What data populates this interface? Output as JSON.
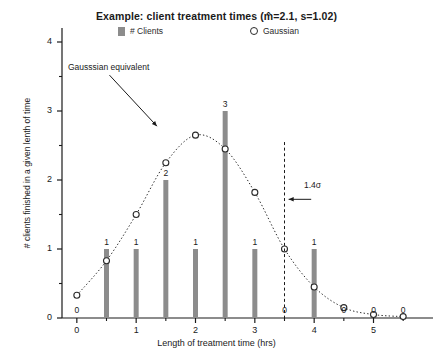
{
  "chart_data": {
    "type": "bar",
    "title": "Example: client treatment times (m̂=2.1, s=1.02)",
    "xlabel": "Length of treatment time (hrs)",
    "ylabel": "# clients finished in a given lenth of time",
    "xlim": [
      -0.25,
      5.75
    ],
    "ylim": [
      0,
      4
    ],
    "grid": false,
    "legend_position": "top",
    "x_ticks": [
      0,
      1,
      2,
      3,
      4,
      5
    ],
    "x_tick_labels": [
      "0",
      "1",
      "2",
      "3",
      "4",
      "5"
    ],
    "x_minor_ticks": [
      0.5,
      1.5,
      2.5,
      3.5,
      4.5,
      5.5
    ],
    "y_ticks": [
      0,
      1,
      2,
      3,
      4
    ],
    "y_tick_labels": [
      "0",
      "1",
      "2",
      "3",
      "4"
    ],
    "y_minor_ticks": [
      0.5,
      1.5,
      2.5,
      3.5
    ],
    "categories": [
      0,
      0.5,
      1,
      1.5,
      2,
      2.5,
      3,
      3.5,
      4
    ],
    "series": [
      {
        "name": "# Clients",
        "type": "bar",
        "color": "#8c8c8c",
        "x": [
          0,
          0.5,
          1,
          1.5,
          2,
          2.5,
          3,
          3.5,
          4
        ],
        "values": [
          0,
          1,
          1,
          2,
          1,
          3,
          1,
          0,
          1
        ],
        "point_labels": [
          "",
          "1",
          "1",
          "2",
          "1",
          "3",
          "1",
          "",
          "1"
        ]
      },
      {
        "name": "Gaussian",
        "type": "line",
        "style": "dotted",
        "marker": "open-circle",
        "color": "#2b2b2b",
        "x": [
          0,
          0.5,
          1,
          1.5,
          2,
          2.5,
          3,
          3.5,
          4,
          4.5,
          5,
          5.5
        ],
        "values": [
          0.33,
          0.83,
          1.5,
          2.25,
          2.65,
          2.45,
          1.82,
          1.0,
          0.45,
          0.15,
          0.05,
          0.02
        ],
        "point_labels": [
          "0",
          "",
          "",
          "",
          "",
          "",
          "",
          "0",
          "",
          "0",
          "0",
          "0"
        ]
      }
    ],
    "annotations": [
      {
        "name": "gaussian-equivalent",
        "text": "Gausssian equivalent",
        "arrow_from": [
          0.55,
          3.52
        ],
        "arrow_to": [
          1.35,
          2.78
        ]
      },
      {
        "name": "sigma-marker",
        "text": "1.4σ",
        "vline_x": 3.5,
        "vline_style": "dashed",
        "arrow_from": [
          3.95,
          1.72
        ],
        "arrow_to": [
          3.57,
          1.72
        ]
      }
    ]
  },
  "legend": {
    "clients_label": "# Clients",
    "gaussian_label": "Gaussian"
  }
}
